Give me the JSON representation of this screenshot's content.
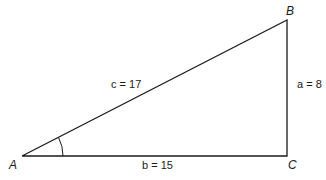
{
  "diagram": {
    "type": "right-triangle",
    "vertices": {
      "A": {
        "label": "A",
        "x": 22,
        "y": 156
      },
      "B": {
        "label": "B",
        "x": 287,
        "y": 20
      },
      "C": {
        "label": "C",
        "x": 287,
        "y": 156
      }
    },
    "sides": {
      "c": {
        "label": "c = 17",
        "var": "c",
        "value": "17"
      },
      "a": {
        "label": "a = 8",
        "var": "a",
        "value": "8"
      },
      "b": {
        "label": "b = 15",
        "var": "b",
        "value": "15"
      }
    },
    "angle_marker": {
      "at": "A",
      "radius": 41
    },
    "colors": {
      "stroke": "#1a1a1a",
      "background": "#ffffff"
    }
  }
}
